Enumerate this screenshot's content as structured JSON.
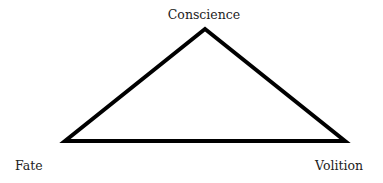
{
  "diagram": {
    "type": "triangle",
    "stroke_color": "#000000",
    "fill_color": "#ffffff",
    "vertices": {
      "top": {
        "label": "Conscience",
        "x": 205,
        "y": 29
      },
      "bottom_left": {
        "label": "Fate",
        "x": 65,
        "y": 141
      },
      "bottom_right": {
        "label": "Volition",
        "x": 345,
        "y": 141
      }
    }
  }
}
